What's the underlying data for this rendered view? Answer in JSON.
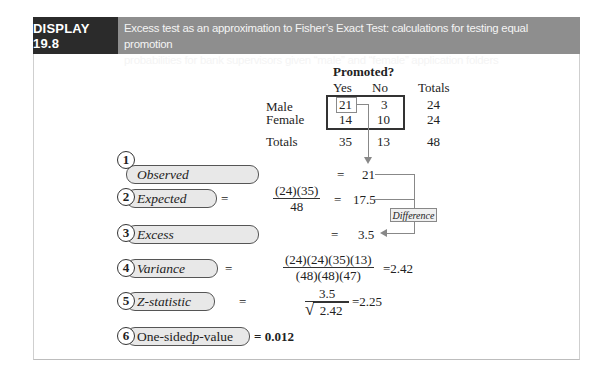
{
  "header": {
    "label": "DISPLAY 19.8",
    "caption_line1": "Excess test as an approximation to Fisher’s Exact Test: calculations for testing equal promotion",
    "caption_line2": "probabilities for bank supervisors given “male” and “female” application folders"
  },
  "table": {
    "title": "Promoted?",
    "columns": [
      "Yes",
      "No",
      "Totals"
    ],
    "rows": [
      {
        "label": "Male",
        "yes": "21",
        "no": "3",
        "total": "24"
      },
      {
        "label": "Female",
        "yes": "14",
        "no": "10",
        "total": "24"
      }
    ],
    "totals": {
      "label": "Totals",
      "yes": "35",
      "no": "13",
      "total": "48"
    }
  },
  "steps": [
    {
      "num": "1",
      "label": "Observed",
      "eq": "=",
      "result": "21"
    },
    {
      "num": "2",
      "label": "Expected",
      "eq": "=",
      "numerator": "(24)(35)",
      "denominator": "48",
      "eq2": "=",
      "result": "17.5"
    },
    {
      "num": "3",
      "label": "Excess",
      "eq": "=",
      "result": "3.5"
    },
    {
      "num": "4",
      "label": "Variance",
      "eq": "=",
      "numerator": "(24)(24)(35)(13)",
      "denominator": "(48)(48)(47)",
      "result": "=2.42"
    },
    {
      "num": "5",
      "label": "Z-statistic",
      "eq": "=",
      "numerator": "3.5",
      "denominator": "2.42",
      "sqrt": "√",
      "result": "=2.25"
    },
    {
      "num": "6",
      "label_prefix": "One-sided ",
      "label_italic": "p",
      "label_suffix": "-value",
      "result": "= 0.012"
    }
  ],
  "annotation": {
    "difference": "Difference"
  }
}
